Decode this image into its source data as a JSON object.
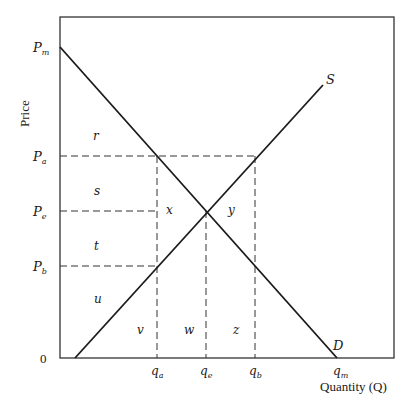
{
  "diagram": {
    "type": "supply-demand",
    "axes": {
      "x_title": "Quantity (Q)",
      "y_title": "Price",
      "origin": "0"
    },
    "price_labels": {
      "pm": {
        "main": "P",
        "sub": "m"
      },
      "pa": {
        "main": "P",
        "sub": "a"
      },
      "pe": {
        "main": "P",
        "sub": "e"
      },
      "pb": {
        "main": "P",
        "sub": "b"
      }
    },
    "quantity_labels": {
      "qa": {
        "main": "q",
        "sub": "a"
      },
      "qe": {
        "main": "q",
        "sub": "e"
      },
      "qb": {
        "main": "q",
        "sub": "b"
      },
      "qm": {
        "main": "q",
        "sub": "m"
      }
    },
    "curves": {
      "supply": "S",
      "demand": "D"
    },
    "regions": {
      "r": "r",
      "s": "s",
      "t": "t",
      "u": "u",
      "v": "v",
      "w": "w",
      "x": "x",
      "y": "y",
      "z": "z"
    },
    "colors": {
      "line": "#1a1a1a",
      "frame": "#333333",
      "background": "#ffffff"
    }
  }
}
